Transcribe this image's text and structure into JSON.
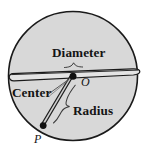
{
  "figure": {
    "kind": "geometry-diagram",
    "background_color": "#ffffff",
    "circle": {
      "fill_color": "#d8d8d8",
      "stroke_color": "#1a1a1a",
      "center_x": 73,
      "center_y": 76,
      "radius": 65
    },
    "labels": {
      "diameter": "Diameter",
      "center": "Center",
      "radius": "Radius",
      "center_point": "O",
      "circumference_point": "P"
    },
    "annotations": {
      "diameter_endpoints": [
        {
          "x": 9,
          "y": 78
        },
        {
          "x": 138,
          "y": 72
        }
      ],
      "center_point": {
        "x": 73,
        "y": 76
      },
      "circumference_point": {
        "x": 43,
        "y": 126
      }
    },
    "colors": {
      "stroke": "#1a1a1a",
      "fill": "#d8d8d8",
      "text": "#141414",
      "leader": "#4a4a4a"
    }
  }
}
